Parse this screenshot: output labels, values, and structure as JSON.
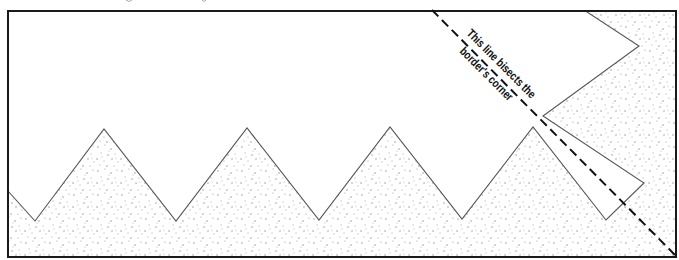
{
  "diagram": {
    "type": "border-corner-illustration",
    "frame": {
      "x": 7,
      "y": 10,
      "width": 670,
      "height": 247,
      "stroke": "#1a1a1a"
    },
    "fill_pattern": "stipple",
    "colors": {
      "stroke": "#555555",
      "frame": "#1a1a1a",
      "dots": "#9a9a9a",
      "dash": "#111111",
      "background": "#ffffff"
    },
    "zigzag_points": [
      [
        8,
        191
      ],
      [
        35,
        221
      ],
      [
        104,
        129
      ],
      [
        176,
        221
      ],
      [
        247,
        128
      ],
      [
        319,
        220
      ],
      [
        390,
        127
      ],
      [
        462,
        219
      ],
      [
        533,
        127
      ],
      [
        606,
        220
      ],
      [
        644,
        183
      ],
      [
        543,
        116
      ],
      [
        639,
        46
      ],
      [
        584,
        10
      ]
    ],
    "bisector": {
      "from": [
        432,
        10
      ],
      "to": [
        677,
        257
      ],
      "style": "dashed"
    },
    "annotation": {
      "line1": "This line bisects the",
      "line2": "border's corner",
      "rotation_deg": 45
    }
  }
}
